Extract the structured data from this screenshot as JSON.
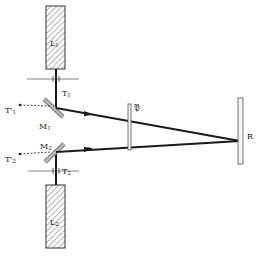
{
  "diagram": {
    "type": "optical-setup",
    "components": {
      "L1": {
        "label": "L",
        "sub": "1",
        "kind": "laser"
      },
      "L2": {
        "label": "L",
        "sub": "2",
        "kind": "laser"
      },
      "T1": {
        "label": "T",
        "sub": "1",
        "kind": "stop"
      },
      "T2": {
        "label": "T",
        "sub": "2",
        "kind": "stop"
      },
      "T1p": {
        "label": "T",
        "sup": "'",
        "sub": "1",
        "kind": "target"
      },
      "T2p": {
        "label": "T",
        "sup": "'",
        "sub": "2",
        "kind": "target"
      },
      "M1": {
        "label": "M",
        "sub": "1",
        "kind": "mirror"
      },
      "M2": {
        "label": "M",
        "sub": "2",
        "kind": "mirror"
      },
      "P": {
        "label": "𝔓",
        "kind": "plate"
      },
      "R": {
        "label": "R",
        "kind": "screen"
      }
    },
    "colors": {
      "line": "#1a1a1a",
      "hatch": "#555555",
      "plate_fill": "#f4f4f4",
      "mirror_fill": "#a8a8a8"
    }
  }
}
